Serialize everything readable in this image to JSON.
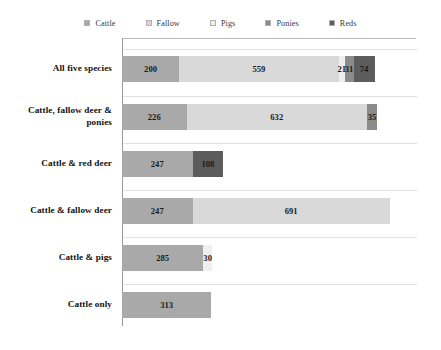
{
  "chart_data": {
    "type": "bar",
    "orientation": "horizontal",
    "stacked": true,
    "title": "",
    "xlabel": "",
    "ylabel": "",
    "grid": true,
    "legend_position": "top",
    "xlim": [
      0,
      1050
    ],
    "categories": [
      "All five species",
      "Cattle, fallow deer & ponies",
      "Cattle & red deer",
      "Cattle & fallow deer",
      "Cattle & pigs",
      "Cattle only"
    ],
    "series": [
      {
        "name": "Cattle",
        "color": "#a9a9a9",
        "values": [
          200,
          226,
          247,
          247,
          285,
          313
        ]
      },
      {
        "name": "Fallow",
        "color": "#d9d9d9",
        "values": [
          559,
          632,
          0,
          691,
          0,
          0
        ]
      },
      {
        "name": "Pigs",
        "color": "#efefef",
        "values": [
          21,
          0,
          0,
          0,
          30,
          0
        ]
      },
      {
        "name": "Ponies",
        "color": "#8b8b8b",
        "values": [
          31,
          35,
          0,
          0,
          0,
          0
        ]
      },
      {
        "name": "Reds",
        "color": "#5c5c5c",
        "values": [
          74,
          0,
          108,
          0,
          0,
          0
        ]
      }
    ],
    "totals": [
      885,
      893,
      355,
      938,
      315,
      313
    ]
  },
  "legend": {
    "items": [
      {
        "label": "Cattle",
        "color": "#a9a9a9"
      },
      {
        "label": "Fallow",
        "color": "#d9d9d9"
      },
      {
        "label": "Pigs",
        "color": "#efefef"
      },
      {
        "label": "Ponies",
        "color": "#8b8b8b"
      },
      {
        "label": "Reds",
        "color": "#5c5c5c"
      }
    ]
  },
  "rows": [
    {
      "category": "All five species",
      "segments": [
        {
          "series": "Cattle",
          "value": 200,
          "label": "200",
          "color": "#a9a9a9",
          "show_label": true,
          "outside": false
        },
        {
          "series": "Fallow",
          "value": 559,
          "label": "559",
          "color": "#d9d9d9",
          "show_label": true,
          "outside": false
        },
        {
          "series": "Pigs",
          "value": 21,
          "label": "21",
          "color": "#efefef",
          "show_label": true,
          "outside": false
        },
        {
          "series": "Ponies",
          "value": 31,
          "label": "31",
          "color": "#8b8b8b",
          "show_label": true,
          "outside": false
        },
        {
          "series": "Reds",
          "value": 74,
          "label": "74",
          "color": "#5c5c5c",
          "show_label": true,
          "outside": false
        }
      ]
    },
    {
      "category": "Cattle, fallow deer & ponies",
      "segments": [
        {
          "series": "Cattle",
          "value": 226,
          "label": "226",
          "color": "#a9a9a9",
          "show_label": true,
          "outside": false
        },
        {
          "series": "Fallow",
          "value": 632,
          "label": "632",
          "color": "#d9d9d9",
          "show_label": true,
          "outside": false
        },
        {
          "series": "Ponies",
          "value": 35,
          "label": "35",
          "color": "#8b8b8b",
          "show_label": true,
          "outside": false
        }
      ]
    },
    {
      "category": "Cattle & red deer",
      "segments": [
        {
          "series": "Cattle",
          "value": 247,
          "label": "247",
          "color": "#a9a9a9",
          "show_label": true,
          "outside": false
        },
        {
          "series": "Reds",
          "value": 108,
          "label": "108",
          "color": "#5c5c5c",
          "show_label": true,
          "outside": false
        }
      ]
    },
    {
      "category": "Cattle & fallow deer",
      "segments": [
        {
          "series": "Cattle",
          "value": 247,
          "label": "247",
          "color": "#a9a9a9",
          "show_label": true,
          "outside": false
        },
        {
          "series": "Fallow",
          "value": 691,
          "label": "691",
          "color": "#d9d9d9",
          "show_label": true,
          "outside": false
        }
      ]
    },
    {
      "category": "Cattle & pigs",
      "segments": [
        {
          "series": "Cattle",
          "value": 285,
          "label": "285",
          "color": "#a9a9a9",
          "show_label": true,
          "outside": false
        },
        {
          "series": "Pigs",
          "value": 30,
          "label": "30",
          "color": "#efefef",
          "show_label": true,
          "outside": false
        }
      ]
    },
    {
      "category": "Cattle only",
      "segments": [
        {
          "series": "Cattle",
          "value": 313,
          "label": "313",
          "color": "#a9a9a9",
          "show_label": true,
          "outside": false
        }
      ]
    }
  ],
  "layout": {
    "plot_left": 122,
    "plot_top": 38,
    "plot_width": 294,
    "plot_height": 288,
    "px_per_unit": 0.2855,
    "bar_height": 26,
    "row_tops": [
      56,
      104,
      151,
      198,
      245,
      292
    ],
    "gridline_tops": [
      48,
      95,
      142,
      189,
      236,
      283
    ],
    "label_tops": [
      62,
      104,
      157,
      204,
      251,
      298
    ]
  },
  "colors": {
    "axis": "#9a9a9a",
    "grid": "#e2e2e2",
    "text": "#111111",
    "background": "#ffffff"
  }
}
